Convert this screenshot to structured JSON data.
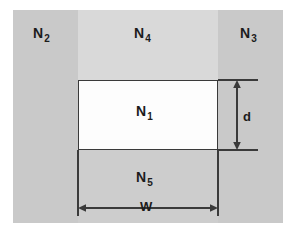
{
  "figure": {
    "type": "cross-section-refractive-index-diagram",
    "regions": [
      {
        "id": "n2",
        "label": "N",
        "subscript": "2",
        "fill": "#c9c9c9",
        "position": "left-cladding"
      },
      {
        "id": "n4",
        "label": "N",
        "subscript": "4",
        "fill": "#d9d9d9",
        "position": "top-cladding"
      },
      {
        "id": "n3",
        "label": "N",
        "subscript": "3",
        "fill": "#c9c9c9",
        "position": "right-cladding"
      },
      {
        "id": "n1",
        "label": "N",
        "subscript": "1",
        "fill": "#fdfdfd",
        "position": "core"
      },
      {
        "id": "n5",
        "label": "N",
        "subscript": "5",
        "fill": "#cdcdcd",
        "position": "bottom-cladding"
      }
    ],
    "dimensions": [
      {
        "id": "d",
        "label": "d",
        "orientation": "vertical",
        "measures": "core-height"
      },
      {
        "id": "w",
        "label": "W",
        "orientation": "horizontal",
        "measures": "core-width"
      }
    ],
    "colors": {
      "outer_cladding": "#c9c9c9",
      "top_cladding": "#d9d9d9",
      "bottom_cladding": "#cdcdcd",
      "core": "#fdfdfd",
      "line": "#3a3a3a",
      "text": "#1c1c1c",
      "background": "#ffffff"
    }
  }
}
